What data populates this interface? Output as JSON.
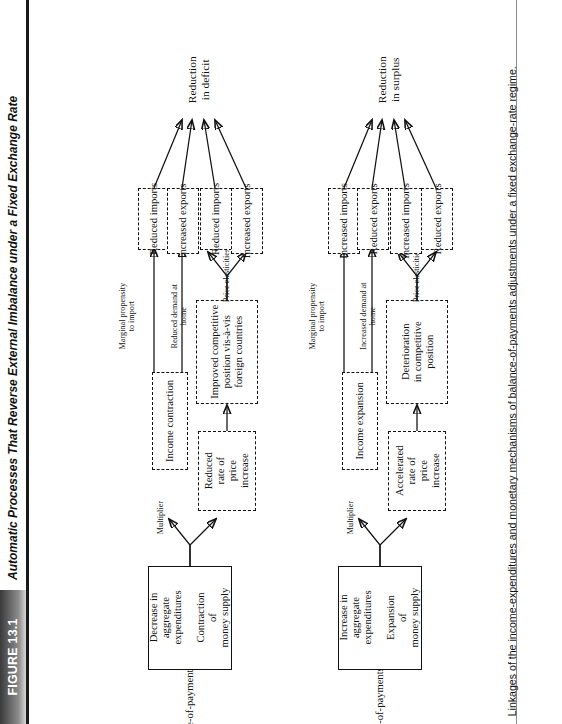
{
  "figure": {
    "number_label": "FIGURE 13.1",
    "title": "Automatic Processes That Reverse External Imbalance under a Fixed Exchange Rate",
    "caption": "Linkages of the income-expenditures and monetary mechanisms of balance-of-payments adjustments under a fixed exchange-rate regime."
  },
  "diagram": {
    "type": "flowchart",
    "orientation": "rotated-90-ccw",
    "flows": [
      {
        "id": "deficit",
        "trigger": "Balance-of-payments deficit",
        "source_box": {
          "line1": "Decrease in",
          "line2": "aggregate",
          "line3": "expenditures",
          "line4": "Contraction",
          "line5": "of",
          "line6": "money supply"
        },
        "branches": [
          {
            "id": "income-mechanism",
            "arrow_label": "Multiplier",
            "mid_box": "Income contraction",
            "edges": [
              {
                "label_line1": "Marginal propensity",
                "label_line2": "to import",
                "target": "Reduced imports"
              },
              {
                "label_line1": "Reduced demand at",
                "label_line2": "home",
                "target": "Increased exports"
              }
            ]
          },
          {
            "id": "monetary-mechanism",
            "price_box": {
              "line1": "Reduced",
              "line2": "rate of",
              "line3": "price",
              "line4": "increase"
            },
            "competitive_box": {
              "line1": "Improved competitive",
              "line2": "position vis-à-vis",
              "line3": "foreign countries"
            },
            "arrow_label": "Price elasticities",
            "targets": [
              "Reduced imports",
              "Increased exports"
            ]
          }
        ],
        "outcome": {
          "line1": "Reduction",
          "line2": "in deficit"
        }
      },
      {
        "id": "surplus",
        "trigger": "Balance-of-payments surplus",
        "source_box": {
          "line1": "Increase in",
          "line2": "aggregate",
          "line3": "expenditures",
          "line4": "Expansion",
          "line5": "of",
          "line6": "money supply"
        },
        "branches": [
          {
            "id": "income-mechanism",
            "arrow_label": "Multiplier",
            "mid_box": "Income expansion",
            "edges": [
              {
                "label_line1": "Marginal propensity",
                "label_line2": "to import",
                "target": "Increased imports"
              },
              {
                "label_line1": "Increased demand at",
                "label_line2": "home",
                "target": "Reduced exports"
              }
            ]
          },
          {
            "id": "monetary-mechanism",
            "price_box": {
              "line1": "Accelerated",
              "line2": "rate of",
              "line3": "price",
              "line4": "increase"
            },
            "competitive_box": {
              "line1": "Deterioration",
              "line2": "in competitive",
              "line3": "position"
            },
            "arrow_label": "Price elasticities",
            "targets": [
              "Increased imports",
              "Reduced exports"
            ]
          }
        ],
        "outcome": {
          "line1": "Reduction",
          "line2": "in surplus"
        }
      }
    ]
  }
}
